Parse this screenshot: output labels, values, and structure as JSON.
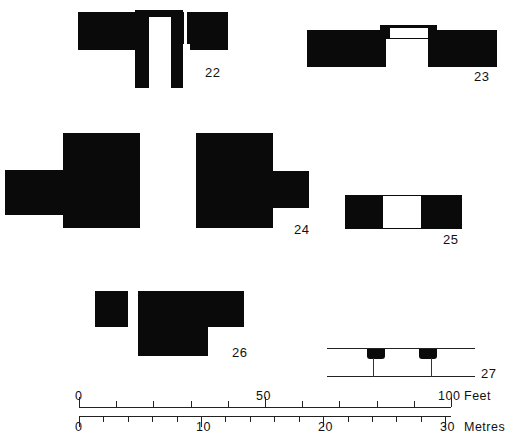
{
  "sheet": {
    "background_color": "#ffffff",
    "ink_color": "#0a0a0a",
    "type": "archaeological-building-plans"
  },
  "figures": [
    {
      "id": "fig-22",
      "label": "22",
      "kind": "plan",
      "description": "T-shaped building plan with open central court"
    },
    {
      "id": "fig-23",
      "label": "23",
      "kind": "plan",
      "description": "Long rectangular block with two central open rooms"
    },
    {
      "id": "fig-24a",
      "label": "",
      "kind": "plan",
      "description": "Solid block with left wing projection"
    },
    {
      "id": "fig-24",
      "label": "24",
      "kind": "plan",
      "description": "Solid block with right wing projection"
    },
    {
      "id": "fig-25",
      "label": "25",
      "kind": "plan",
      "description": "Narrow rectangular block with central open room"
    },
    {
      "id": "fig-26",
      "label": "26",
      "kind": "plan",
      "description": "L-shaped block with narrow open slot at left"
    },
    {
      "id": "fig-27",
      "label": "27",
      "kind": "section",
      "description": "Cross-section showing two wall stubs between two ground lines"
    }
  ],
  "scale_bar": {
    "feet": {
      "unit_label": "Feet",
      "labels": [
        "0",
        "50",
        "100"
      ],
      "label_values": [
        0,
        50,
        100
      ],
      "min": 0,
      "max": 100,
      "minor_step": 10
    },
    "metres": {
      "unit_label": "Metres",
      "labels": [
        "0",
        "10",
        "20",
        "30"
      ],
      "label_values": [
        0,
        10,
        20,
        30
      ],
      "min": 0,
      "max": 30.48,
      "minor_step": 2
    }
  }
}
